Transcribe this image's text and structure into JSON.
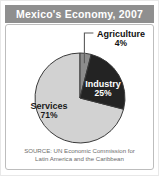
{
  "figure": {
    "title": "Mexico's Economy, 2007",
    "source_line_1": "SOURCE: UN Economic Commission for",
    "source_line_2": "Latin America and the Caribbean"
  },
  "labels": {
    "agriculture_name": "Agriculture",
    "agriculture_value": "4%",
    "industry_name": "Industry",
    "industry_value": "25%",
    "services_name": "Services",
    "services_value": "71%"
  },
  "colors": {
    "title_bar": "#8f8f8f",
    "title_text": "#ffffff",
    "panel_border": "#bdbdbd",
    "agriculture": "#8c8c8c",
    "industry": "#232323",
    "services": "#d2d2d2",
    "slice_outline": "#3a3a3a",
    "source_text": "#6d6d6d"
  },
  "chart_data": {
    "type": "pie",
    "title": "Mexico's Economy, 2007",
    "subtitle": "",
    "xlabel": "",
    "ylabel": "",
    "units": "percent of economy",
    "legend_position": "none (direct slice labels)",
    "grid": false,
    "start_angle_deg": 0,
    "direction": "clockwise",
    "categories": [
      "Agriculture",
      "Industry",
      "Services"
    ],
    "values": [
      4,
      25,
      71
    ],
    "slices": [
      {
        "label": "Agriculture",
        "value": 4,
        "display": "4%",
        "color": "#8c8c8c",
        "label_placement": "outside-top-right-with-leader"
      },
      {
        "label": "Industry",
        "value": 25,
        "display": "25%",
        "color": "#232323",
        "label_placement": "inside-right"
      },
      {
        "label": "Services",
        "value": 71,
        "display": "71%",
        "color": "#d2d2d2",
        "label_placement": "inside-left"
      }
    ],
    "total": 100,
    "annotations": [
      "SOURCE: UN Economic Commission for Latin America and the Caribbean"
    ]
  }
}
